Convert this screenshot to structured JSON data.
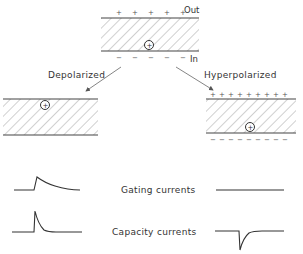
{
  "diagram": {
    "type": "membrane gating charge schematic",
    "top_membrane": {
      "outside_label": "Out",
      "inside_label": "In",
      "outer_charge_sign": "+",
      "inner_charge_sign": "−",
      "mobile_charge_symbol": "+",
      "mobile_charge_position": "near inner surface"
    },
    "left_panel": {
      "label": "Depolarized",
      "mobile_charge_position": "near outer surface",
      "surface_charges": "none"
    },
    "right_panel": {
      "label": "Hyperpolarized",
      "outer_charge_sign": "+",
      "inner_charge_sign": "−",
      "mobile_charge_position": "near inner surface"
    },
    "rows": [
      {
        "label": "Gating currents",
        "left_trace": "outward transient: sharp rise then slow exponential decay",
        "right_trace": "flat (no current)"
      },
      {
        "label": "Capacity currents",
        "left_trace": "brief outward spike then fast decay",
        "right_trace": "brief inward spike then fast decay"
      }
    ],
    "colors": {
      "line": "#444444",
      "hatch": "#777777",
      "background": "#ffffff"
    }
  }
}
